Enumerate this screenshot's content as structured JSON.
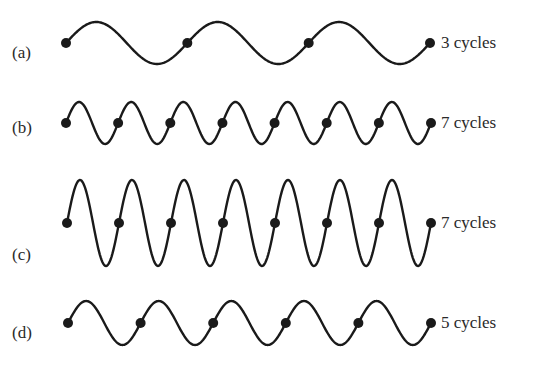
{
  "diagram": {
    "waves": [
      {
        "id": "a",
        "letter": "(a)",
        "cycles_label": "3 cycles",
        "cycles": 3,
        "x0": 66,
        "x1": 430,
        "cy": 43,
        "amp": 21,
        "letter_x": 12,
        "letter_y": 53,
        "label_x": 441,
        "label_y": 33
      },
      {
        "id": "b",
        "letter": "(b)",
        "cycles_label": "7 cycles",
        "cycles": 7,
        "x0": 66,
        "x1": 431,
        "cy": 123,
        "amp": 21,
        "letter_x": 12,
        "letter_y": 128,
        "label_x": 441,
        "label_y": 113
      },
      {
        "id": "c",
        "letter": "(c)",
        "cycles_label": "7 cycles",
        "cycles": 7,
        "x0": 67,
        "x1": 431,
        "cy": 223,
        "amp": 43,
        "letter_x": 12,
        "letter_y": 255,
        "label_x": 441,
        "label_y": 213
      },
      {
        "id": "d",
        "letter": "(d)",
        "cycles_label": "5 cycles",
        "cycles": 5,
        "x0": 68,
        "x1": 431,
        "cy": 323,
        "amp": 22,
        "letter_x": 12,
        "letter_y": 333,
        "label_x": 441,
        "label_y": 313
      }
    ],
    "colors": {
      "stroke": "#1a1a1a",
      "text": "#2a2a2a",
      "background": "#ffffff"
    }
  }
}
